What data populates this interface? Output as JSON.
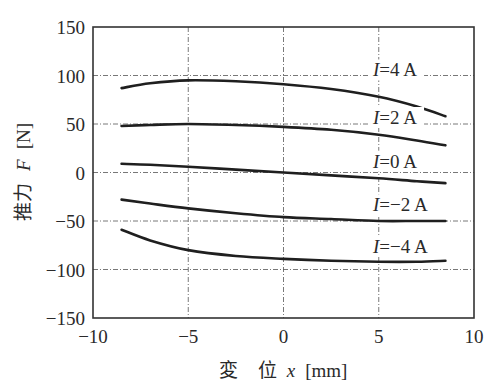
{
  "chart_data": {
    "type": "line",
    "title": "",
    "xlabel": "変 位 x [mm]",
    "ylabel": "推力 F [N]",
    "xlim": [
      -10,
      10
    ],
    "ylim": [
      -150,
      150
    ],
    "xticks": [
      -10,
      -5,
      0,
      5,
      10
    ],
    "yticks": [
      150,
      100,
      50,
      0,
      -50,
      -100,
      -150
    ],
    "xtick_labels": [
      "−10",
      "−5",
      "0",
      "5",
      "10"
    ],
    "ytick_labels": [
      "150",
      "100",
      "50",
      "0",
      "−50",
      "−100",
      "−150"
    ],
    "grid": true,
    "grid_x": [
      -5,
      0,
      5
    ],
    "grid_y": [
      100,
      50,
      0,
      -50,
      -100
    ],
    "legend_position": "inline labels at right of curves",
    "x": [
      -8.5,
      -7,
      -5,
      -2.5,
      0,
      2.5,
      5,
      7,
      8.5
    ],
    "series": [
      {
        "name": "I=4 A",
        "label": "I=4 A",
        "values": [
          87,
          92,
          95,
          94,
          91,
          86,
          78,
          68,
          58
        ]
      },
      {
        "name": "I=2 A",
        "label": "I=2 A",
        "values": [
          48,
          49,
          50,
          49,
          47,
          44,
          39,
          33,
          28
        ]
      },
      {
        "name": "I=0 A",
        "label": "I=0 A",
        "values": [
          9,
          8,
          6,
          3,
          0,
          -3,
          -6,
          -9,
          -11
        ]
      },
      {
        "name": "I=-2 A",
        "label": "I=−2 A",
        "values": [
          -28,
          -32,
          -37,
          -42,
          -46,
          -48,
          -50,
          -50,
          -50
        ]
      },
      {
        "name": "I=-4 A",
        "label": "I=−4 A",
        "values": [
          -59,
          -70,
          -80,
          -86,
          -89,
          -91,
          -92,
          -92,
          -91
        ]
      }
    ],
    "series_label_positions": [
      {
        "x": 4.7,
        "y": 99
      },
      {
        "x": 4.7,
        "y": 50
      },
      {
        "x": 4.7,
        "y": 5
      },
      {
        "x": 4.7,
        "y": -40
      },
      {
        "x": 4.7,
        "y": -83
      }
    ]
  },
  "axes": {
    "xlabel_main": "変",
    "xlabel_rest": "位",
    "xlabel_var": "x",
    "xlabel_unit": "[mm]",
    "ylabel_main": "推力",
    "ylabel_var": "F",
    "ylabel_unit": "[N]"
  },
  "colors": {
    "curve": "#1f1f1f",
    "frame": "#333333",
    "grid": "#555555",
    "background": "#ffffff"
  }
}
